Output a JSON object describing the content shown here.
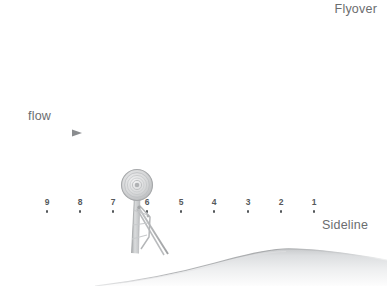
{
  "figure": {
    "type": "technical-illustration",
    "background_color": "#ffffff"
  },
  "labels": {
    "flyover": "Flyover",
    "sideline": "Sideline",
    "flow": "flow"
  },
  "flow_arrow": {
    "name": "flow-direction-arrow",
    "direction": "right",
    "color": "#8e9194"
  },
  "stations": {
    "name": "sideline-measurement-stations",
    "count": 9,
    "dot_color": "#55585b",
    "label_color": "#55585b",
    "items": [
      {
        "label": "9",
        "x": 47,
        "y": 198
      },
      {
        "label": "8",
        "x": 80,
        "y": 198
      },
      {
        "label": "7",
        "x": 113,
        "y": 198
      },
      {
        "label": "6",
        "x": 147,
        "y": 198
      },
      {
        "label": "5",
        "x": 181,
        "y": 198
      },
      {
        "label": "4",
        "x": 214,
        "y": 198
      },
      {
        "label": "3",
        "x": 248,
        "y": 198
      },
      {
        "label": "2",
        "x": 281,
        "y": 198
      },
      {
        "label": "1",
        "x": 314,
        "y": 198
      }
    ]
  },
  "turbine": {
    "name": "wind-turbine",
    "rotor_center_x": 137,
    "rotor_center_y": 185,
    "rotor_radius": 15,
    "rotor_rings": 6,
    "tower_base_x": 140,
    "tower_base_y": 256,
    "color": "#b9bbbd"
  },
  "ground": {
    "name": "hill-terrain",
    "crest_x": 275,
    "crest_y": 245,
    "left_edge_x": 95,
    "left_edge_y": 259,
    "color": "#d6d8da"
  }
}
